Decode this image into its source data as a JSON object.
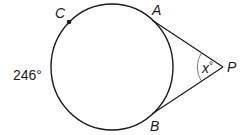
{
  "diagram": {
    "type": "circle-with-tangents",
    "points": {
      "A": {
        "label": "A"
      },
      "B": {
        "label": "B"
      },
      "C": {
        "label": "C"
      },
      "P": {
        "label": "P"
      }
    },
    "arc_label": "246°",
    "angle_label_var": "x",
    "angle_label_deg": "°",
    "colors": {
      "stroke": "#1a1a1a",
      "angle_arc": "#7a7a7a",
      "background": "#ffffff"
    }
  }
}
